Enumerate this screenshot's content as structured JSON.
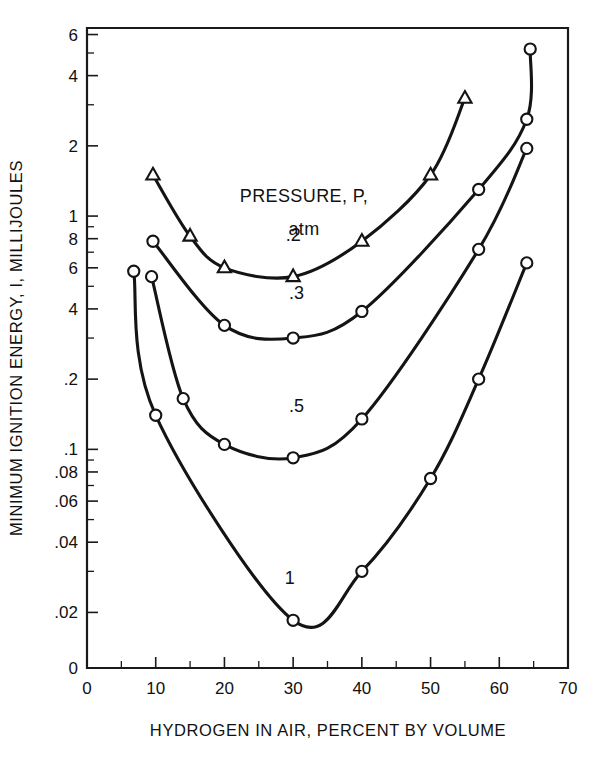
{
  "chart_data": {
    "type": "line",
    "title": "",
    "xlabel": "HYDROGEN IN AIR, PERCENT BY VOLUME",
    "ylabel": "MINIMUM IGNITION ENERGY, I, MILLIJOULES",
    "yscale": "log",
    "xlim": [
      0,
      70
    ],
    "ylim": [
      0.012,
      6.4
    ],
    "grid": false,
    "legend_position": "inside-upper-center",
    "legend_title": "PRESSURE, P,",
    "legend_units": "atm",
    "x_ticks": [
      0,
      10,
      20,
      30,
      40,
      50,
      60,
      70
    ],
    "x_tick_labels": [
      "0",
      "10",
      "20",
      "30",
      "40",
      "50",
      "60",
      "70"
    ],
    "x_minor_ticks": [
      5,
      15,
      25,
      35,
      45,
      55,
      65
    ],
    "y_ticks": [
      6,
      4,
      2,
      1,
      0.8,
      0.6,
      0.4,
      0.2,
      0.1,
      0.08,
      0.06,
      0.04,
      0.02
    ],
    "y_tick_labels": [
      "6",
      "4",
      "2",
      "1",
      "8",
      "6",
      "4",
      ".2",
      ".1",
      ".08",
      ".06",
      ".04",
      ".02"
    ],
    "y_axis_origin_label": "0",
    "series": [
      {
        "name": ".2",
        "label": ".2",
        "pressure_atm": 0.2,
        "marker": "triangle-open",
        "label_x": 30,
        "label_y": 0.78,
        "points": [
          {
            "x": 9.6,
            "y": 1.5
          },
          {
            "x": 15.0,
            "y": 0.82
          },
          {
            "x": 20.0,
            "y": 0.6
          },
          {
            "x": 30.0,
            "y": 0.55
          },
          {
            "x": 40.0,
            "y": 0.78
          },
          {
            "x": 50.0,
            "y": 1.5
          },
          {
            "x": 55.0,
            "y": 3.2
          }
        ]
      },
      {
        "name": ".3",
        "label": ".3",
        "pressure_atm": 0.3,
        "marker": "circle-open",
        "label_x": 30.5,
        "label_y": 0.44,
        "points": [
          {
            "x": 9.6,
            "y": 0.78
          },
          {
            "x": 20.0,
            "y": 0.34
          },
          {
            "x": 30.0,
            "y": 0.3
          },
          {
            "x": 40.0,
            "y": 0.39
          },
          {
            "x": 57.0,
            "y": 1.3
          },
          {
            "x": 64.0,
            "y": 2.6
          },
          {
            "x": 64.5,
            "y": 5.2
          }
        ]
      },
      {
        "name": ".5",
        "label": ".5",
        "pressure_atm": 0.5,
        "marker": "circle-open",
        "label_x": 30.5,
        "label_y": 0.145,
        "points": [
          {
            "x": 9.4,
            "y": 0.55
          },
          {
            "x": 14.0,
            "y": 0.165
          },
          {
            "x": 20.0,
            "y": 0.105
          },
          {
            "x": 30.0,
            "y": 0.092
          },
          {
            "x": 40.0,
            "y": 0.135
          },
          {
            "x": 57.0,
            "y": 0.72
          },
          {
            "x": 64.0,
            "y": 1.95
          }
        ]
      },
      {
        "name": "1",
        "label": "1",
        "pressure_atm": 1,
        "marker": "circle-open",
        "label_x": 29.5,
        "label_y": 0.0265,
        "points": [
          {
            "x": 6.8,
            "y": 0.58
          },
          {
            "x": 10.0,
            "y": 0.14
          },
          {
            "x": 30.0,
            "y": 0.0185
          },
          {
            "x": 40.0,
            "y": 0.03
          },
          {
            "x": 50.0,
            "y": 0.075
          },
          {
            "x": 57.0,
            "y": 0.2
          },
          {
            "x": 64.0,
            "y": 0.63
          }
        ]
      }
    ]
  }
}
